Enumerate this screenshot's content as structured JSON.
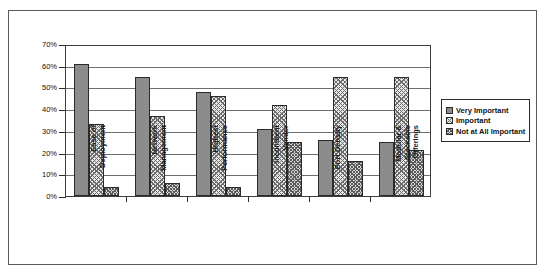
{
  "chart_data": {
    "type": "bar",
    "title": "",
    "xlabel": "",
    "ylabel": "",
    "ylim": [
      0,
      70
    ],
    "ytick_labels": [
      "0%",
      "10%",
      "20%",
      "30%",
      "40%",
      "50%",
      "60%",
      "70%"
    ],
    "ytick_values": [
      0,
      10,
      20,
      30,
      40,
      50,
      60,
      70
    ],
    "grid": true,
    "legend_position": "right",
    "categories": [
      "Ease of\nDeployment",
      "Network\nManagement",
      "Highest\nPerformance",
      "Incumbent\nVendor",
      "Port Density",
      "Modular &\nStackable\nOfferings"
    ],
    "series": [
      {
        "name": "Very Important",
        "values": [
          61,
          55,
          48,
          31,
          26,
          25
        ]
      },
      {
        "name": "Important",
        "values": [
          33,
          37,
          46,
          42,
          55,
          55
        ]
      },
      {
        "name": "Not at All Important",
        "values": [
          4,
          6,
          4,
          25,
          16,
          21
        ]
      }
    ]
  },
  "legend": {
    "items": [
      {
        "label": "Very Important"
      },
      {
        "label": "Important"
      },
      {
        "label": "Not at All Important"
      }
    ]
  },
  "colors": {
    "series_1": "#8c8c8c",
    "series_2": "#e8e8e8",
    "series_3": "#d8d8d8",
    "axis": "#2b2b2b",
    "grid": "#6e6e6e",
    "background": "#ffffff"
  }
}
